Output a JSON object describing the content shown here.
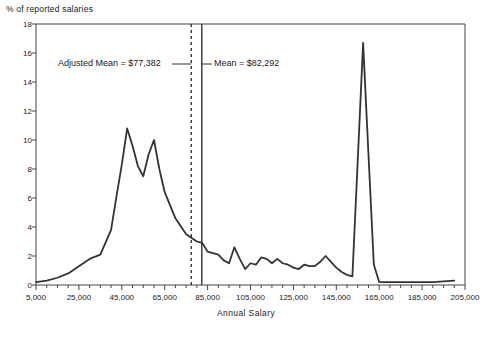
{
  "chart_data": {
    "type": "line",
    "title": "",
    "xlabel": "Annual Salary",
    "ylabel": "% of reported salaries",
    "xlim": [
      5000,
      205000
    ],
    "ylim": [
      0,
      18
    ],
    "grid": false,
    "legend": "none",
    "x_ticks": [
      5000,
      25000,
      45000,
      65000,
      85000,
      105000,
      125000,
      145000,
      165000,
      185000,
      205000
    ],
    "x_tick_labels": [
      "5,000",
      "25,000",
      "45,000",
      "65,000",
      "85,000",
      "105,000",
      "125,000",
      "145,000",
      "165,000",
      "185,000",
      "205,000"
    ],
    "x_minor_step": 5000,
    "y_ticks": [
      0,
      2,
      4,
      6,
      8,
      10,
      12,
      14,
      16,
      18
    ],
    "y_tick_labels": [
      "0",
      "2",
      "4",
      "6",
      "8",
      "10",
      "12",
      "14",
      "16",
      "18"
    ],
    "series": [
      {
        "name": "% of reported salaries",
        "x": [
          5000,
          10000,
          15000,
          20000,
          25000,
          30000,
          35000,
          40000,
          42500,
          45000,
          47500,
          50000,
          52500,
          55000,
          57500,
          60000,
          62500,
          65000,
          70000,
          75000,
          80000,
          82500,
          85000,
          87500,
          90000,
          92500,
          95000,
          97500,
          100000,
          102500,
          105000,
          107500,
          110000,
          112500,
          115000,
          117500,
          120000,
          122500,
          125000,
          127500,
          130000,
          132500,
          135000,
          137500,
          140000,
          142500,
          145000,
          147500,
          150000,
          152500,
          155000,
          157500,
          160000,
          162500,
          165000,
          170000,
          175000,
          180000,
          185000,
          190000,
          195000,
          200000
        ],
        "y": [
          0.2,
          0.3,
          0.5,
          0.8,
          1.3,
          1.8,
          2.1,
          3.8,
          6.1,
          8.3,
          10.8,
          9.6,
          8.2,
          7.5,
          9.0,
          10.0,
          8.0,
          6.4,
          4.6,
          3.5,
          3.0,
          2.9,
          2.3,
          2.2,
          2.1,
          1.7,
          1.5,
          2.6,
          1.8,
          1.1,
          1.5,
          1.4,
          1.9,
          1.8,
          1.5,
          1.8,
          1.5,
          1.4,
          1.2,
          1.1,
          1.4,
          1.3,
          1.3,
          1.6,
          2.0,
          1.6,
          1.2,
          0.9,
          0.7,
          0.6,
          8.6,
          16.7,
          9.0,
          1.4,
          0.2,
          0.2,
          0.2,
          0.2,
          0.2,
          0.2,
          0.25,
          0.3
        ]
      }
    ],
    "annotations": [
      {
        "name": "adjusted-mean",
        "label": "Adjusted Mean = $77,382",
        "value": 77382,
        "line_style": "dashed"
      },
      {
        "name": "mean",
        "label": "Mean = $82,292",
        "value": 82292,
        "line_style": "solid"
      }
    ]
  },
  "colors": {
    "line": "#333333",
    "axis": "#444444",
    "text": "#1a1a1a",
    "annotation_rule": "#333333"
  }
}
